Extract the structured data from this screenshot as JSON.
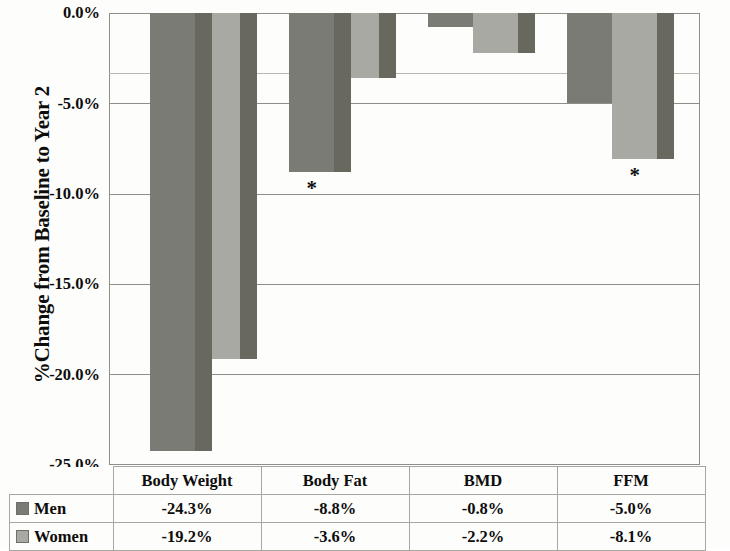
{
  "chart_data": {
    "type": "bar",
    "title": "",
    "subtitle": "",
    "xlabel": "",
    "ylabel": "%Change from Baseline to Year 2",
    "categories": [
      "Body Weight",
      "Body Fat",
      "BMD",
      "FFM"
    ],
    "series": [
      {
        "name": "Men",
        "values": [
          -24.3,
          -8.8,
          -0.8,
          -5.0
        ],
        "color": "#7b7b76"
      },
      {
        "name": "Women",
        "values": [
          -19.2,
          -3.6,
          -2.2,
          -8.1
        ],
        "color": "#a9a9a4"
      }
    ],
    "value_labels": {
      "Men": [
        "-24.3%",
        "-8.8%",
        "-0.8%",
        "-5.0%"
      ],
      "Women": [
        "-19.2%",
        "-3.6%",
        "-2.2%",
        "-8.1%"
      ]
    },
    "ylim": [
      -25.0,
      0.0
    ],
    "ytick_labels": [
      "0.0%",
      "-5.0%",
      "-10.0%",
      "-15.0%",
      "-20.0%",
      "-25.0%"
    ],
    "ytick_values": [
      0.0,
      -5.0,
      -10.0,
      -15.0,
      -20.0,
      -25.0
    ],
    "grid": true,
    "legend_position": "data-table-left",
    "annotations": [
      {
        "text": "*",
        "category": "Body Fat",
        "series": "Men",
        "meaning": "significance-marker"
      },
      {
        "text": "*",
        "category": "FFM",
        "series": "Women",
        "meaning": "significance-marker"
      }
    ],
    "colors": {
      "men_face": "#7b7b76",
      "men_side": "#68685f",
      "women_face": "#a9a9a4",
      "women_side": "#68685f",
      "gridline": "#8f8f8a",
      "text": "#0d0d0d"
    }
  },
  "axis": {
    "y_title": "%Change from Baseline to Year 2",
    "ticks": [
      "0.0%",
      "-5.0%",
      "-10.0%",
      "-15.0%",
      "-20.0%",
      "-25.0%"
    ]
  },
  "table": {
    "corner_label": "",
    "column_headers": [
      "Body Weight",
      "Body Fat",
      "BMD",
      "FFM"
    ],
    "rows": [
      {
        "series": "Men",
        "cells": [
          "-24.3%",
          "-8.8%",
          "-0.8%",
          "-5.0%"
        ]
      },
      {
        "series": "Women",
        "cells": [
          "-19.2%",
          "-3.6%",
          "-2.2%",
          "-8.1%"
        ]
      }
    ]
  },
  "annotations": {
    "star_body_fat": "*",
    "star_ffm": "*"
  }
}
